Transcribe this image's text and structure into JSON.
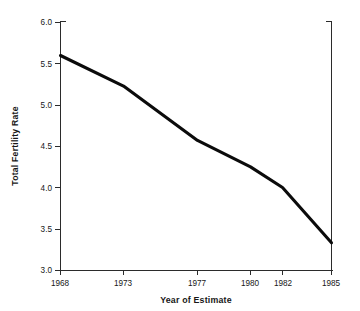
{
  "chart_data": {
    "type": "line",
    "title": "",
    "subtitle": "",
    "xlabel": "Year of Estimate",
    "ylabel": "Total Fertility Rate",
    "x": [
      1968,
      1973,
      1977,
      1980,
      1982,
      1985
    ],
    "categories": [
      "1968",
      "1973",
      "1977",
      "1980",
      "1982",
      "1985"
    ],
    "values": [
      5.6,
      5.23,
      4.57,
      4.25,
      4.0,
      3.33
    ],
    "series": [
      {
        "name": "Total Fertility Rate",
        "values": [
          5.6,
          5.23,
          4.57,
          4.25,
          4.0,
          3.33
        ],
        "color": "#0b0b0b"
      }
    ],
    "xtick_labels": [
      "1968",
      "1973",
      "1977",
      "1980",
      "1982",
      "1985"
    ],
    "xtick_values": [
      1968,
      1973,
      1977,
      1980,
      1982,
      1985
    ],
    "ytick_labels": [
      "3.0",
      "3.5",
      "4.0",
      "4.5",
      "5.0",
      "5.5",
      "6.0"
    ],
    "ytick_values": [
      3.0,
      3.5,
      4.0,
      4.5,
      5.0,
      5.5,
      6.0
    ],
    "xlim": [
      1968,
      1985
    ],
    "ylim": [
      3.0,
      6.0
    ],
    "grid": false,
    "legend": false,
    "legend_position": "none",
    "annotations": [],
    "axis_note": "x-axis tick spacing is non-uniform (category-style ordinal placement)"
  },
  "axes": {
    "ylabel": "Total Fertility Rate",
    "xlabel": "Year of Estimate",
    "ytick_0": "3.0",
    "ytick_1": "3.5",
    "ytick_2": "4.0",
    "ytick_3": "4.5",
    "ytick_4": "5.0",
    "ytick_5": "5.5",
    "ytick_6": "6.0",
    "xtick_0": "1968",
    "xtick_1": "1973",
    "xtick_2": "1977",
    "xtick_3": "1980",
    "xtick_4": "1982",
    "xtick_5": "1985"
  },
  "style": {
    "line_color": "#0b0b0b",
    "axis_color": "#2b2b2b",
    "text_color": "#171717",
    "background": "#ffffff"
  }
}
